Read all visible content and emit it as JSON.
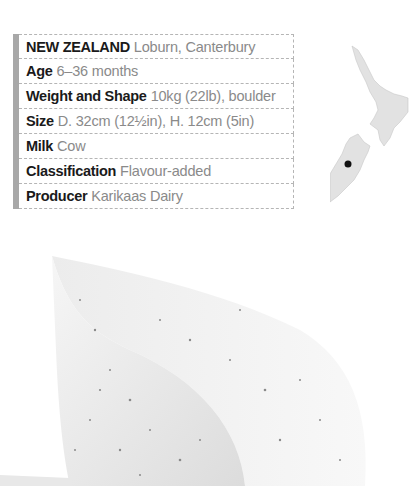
{
  "profile": {
    "rows": [
      {
        "label": "NEW ZEALAND",
        "value": "Loburn, Canterbury"
      },
      {
        "label": "Age",
        "value": "6–36 months"
      },
      {
        "label": "Weight and Shape",
        "value": "10kg (22lb), boulder"
      },
      {
        "label": "Size",
        "value": "D. 32cm (12½in), H. 12cm (5in)"
      },
      {
        "label": "Milk",
        "value": "Cow"
      },
      {
        "label": "Classification",
        "value": "Flavour-added"
      },
      {
        "label": "Producer",
        "value": "Karikaas Dairy"
      }
    ]
  },
  "map": {
    "country": "New Zealand",
    "marker": "Loburn, Canterbury"
  },
  "image": {
    "subject": "herb-speckled cheese wedge"
  }
}
